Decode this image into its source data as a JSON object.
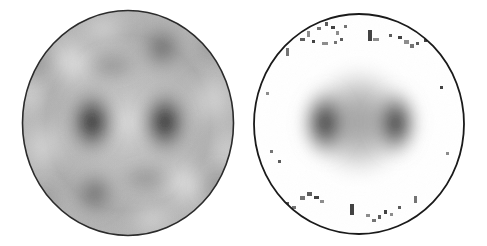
{
  "figure": {
    "title": "",
    "background_color": "#ffffff",
    "width": 487,
    "height": 246,
    "panel_count": 2,
    "layout": "two circular grayscale maps side by side"
  },
  "chart_data": {
    "type": "heatmap",
    "title": "",
    "subtitle": "",
    "xlabel": "",
    "ylabel": "",
    "colormap": "grayscale-inverted",
    "colormap_low_color": "#ffffff",
    "colormap_high_color": "#1a1a1a",
    "grid": false,
    "legend": false,
    "legend_position": "none",
    "panels": [
      {
        "name": "simulated-pattern",
        "label": "",
        "shape": "ellipse",
        "center_x": 128,
        "center_y": 123,
        "radius_x": 106,
        "radius_y": 113,
        "outline_color": "#2b2b2b",
        "outline_width": 1.6,
        "fill_base_gray": "#bdbdbd",
        "noise": "none",
        "description": "smooth continuous grayscale interference pattern with concentric bright ring and four dark lobes",
        "features": [
          {
            "name": "dark-lobe-left",
            "x": 92,
            "y": 122,
            "rx": 22,
            "ry": 30,
            "intensity": 0.96
          },
          {
            "name": "dark-lobe-right",
            "x": 165,
            "y": 122,
            "rx": 22,
            "ry": 30,
            "intensity": 0.96
          },
          {
            "name": "dark-lobe-upper",
            "x": 162,
            "y": 48,
            "rx": 20,
            "ry": 22,
            "intensity": 0.55
          },
          {
            "name": "dark-lobe-lower",
            "x": 95,
            "y": 192,
            "rx": 20,
            "ry": 20,
            "intensity": 0.5
          },
          {
            "name": "bright-node-upper-left",
            "x": 72,
            "y": 62,
            "rx": 24,
            "ry": 22,
            "intensity": 0.92
          },
          {
            "name": "bright-node-lower-right",
            "x": 183,
            "y": 183,
            "rx": 24,
            "ry": 22,
            "intensity": 0.88
          },
          {
            "name": "bright-node-left",
            "x": 45,
            "y": 145,
            "rx": 20,
            "ry": 26,
            "intensity": 0.7
          },
          {
            "name": "bright-node-right",
            "x": 210,
            "y": 100,
            "rx": 20,
            "ry": 26,
            "intensity": 0.7
          },
          {
            "name": "bright-center",
            "x": 128,
            "y": 122,
            "rx": 14,
            "ry": 22,
            "intensity": 0.62
          }
        ]
      },
      {
        "name": "measured-pattern",
        "label": "",
        "shape": "ellipse",
        "center_x": 359,
        "center_y": 124,
        "radius_x": 106,
        "radius_y": 111,
        "outline_color": "#1a1a1a",
        "outline_width": 1.8,
        "fill_base_gray": "#ffffff",
        "noise": "sparse dark speckle artifacts near rim",
        "description": "measured map: hexagonal gray core with two dark lobes, white surround and scattered dark pixel artifacts",
        "features": [
          {
            "name": "core-blob",
            "x": 359,
            "y": 120,
            "rx": 56,
            "ry": 56,
            "intensity": 0.38
          },
          {
            "name": "dark-lobe-left",
            "x": 325,
            "y": 123,
            "rx": 22,
            "ry": 33,
            "intensity": 1.0
          },
          {
            "name": "dark-lobe-right",
            "x": 396,
            "y": 123,
            "rx": 21,
            "ry": 32,
            "intensity": 0.98
          }
        ],
        "speckles": [
          {
            "x": 307,
            "y": 31,
            "w": 3,
            "h": 6
          },
          {
            "x": 317,
            "y": 27,
            "w": 4,
            "h": 3
          },
          {
            "x": 325,
            "y": 22,
            "w": 3,
            "h": 4
          },
          {
            "x": 331,
            "y": 26,
            "w": 4,
            "h": 3
          },
          {
            "x": 336,
            "y": 31,
            "w": 3,
            "h": 4
          },
          {
            "x": 344,
            "y": 25,
            "w": 3,
            "h": 3
          },
          {
            "x": 300,
            "y": 38,
            "w": 5,
            "h": 3
          },
          {
            "x": 312,
            "y": 40,
            "w": 3,
            "h": 3
          },
          {
            "x": 322,
            "y": 42,
            "w": 6,
            "h": 3
          },
          {
            "x": 334,
            "y": 41,
            "w": 3,
            "h": 3
          },
          {
            "x": 340,
            "y": 38,
            "w": 3,
            "h": 3
          },
          {
            "x": 368,
            "y": 30,
            "w": 4,
            "h": 11
          },
          {
            "x": 373,
            "y": 38,
            "w": 6,
            "h": 3
          },
          {
            "x": 286,
            "y": 48,
            "w": 3,
            "h": 8
          },
          {
            "x": 389,
            "y": 34,
            "w": 3,
            "h": 3
          },
          {
            "x": 398,
            "y": 36,
            "w": 4,
            "h": 3
          },
          {
            "x": 404,
            "y": 40,
            "w": 5,
            "h": 4
          },
          {
            "x": 410,
            "y": 44,
            "w": 4,
            "h": 4
          },
          {
            "x": 416,
            "y": 42,
            "w": 3,
            "h": 3
          },
          {
            "x": 424,
            "y": 39,
            "w": 3,
            "h": 3
          },
          {
            "x": 266,
            "y": 92,
            "w": 3,
            "h": 3
          },
          {
            "x": 270,
            "y": 150,
            "w": 3,
            "h": 3
          },
          {
            "x": 278,
            "y": 160,
            "w": 3,
            "h": 3
          },
          {
            "x": 440,
            "y": 86,
            "w": 3,
            "h": 3
          },
          {
            "x": 446,
            "y": 152,
            "w": 3,
            "h": 3
          },
          {
            "x": 300,
            "y": 196,
            "w": 5,
            "h": 4
          },
          {
            "x": 307,
            "y": 192,
            "w": 5,
            "h": 4
          },
          {
            "x": 314,
            "y": 196,
            "w": 5,
            "h": 3
          },
          {
            "x": 320,
            "y": 200,
            "w": 4,
            "h": 3
          },
          {
            "x": 292,
            "y": 206,
            "w": 4,
            "h": 3
          },
          {
            "x": 286,
            "y": 202,
            "w": 3,
            "h": 3
          },
          {
            "x": 350,
            "y": 204,
            "w": 4,
            "h": 11
          },
          {
            "x": 366,
            "y": 214,
            "w": 4,
            "h": 3
          },
          {
            "x": 372,
            "y": 219,
            "w": 4,
            "h": 3
          },
          {
            "x": 378,
            "y": 215,
            "w": 3,
            "h": 4
          },
          {
            "x": 384,
            "y": 210,
            "w": 3,
            "h": 4
          },
          {
            "x": 390,
            "y": 213,
            "w": 3,
            "h": 3
          },
          {
            "x": 414,
            "y": 196,
            "w": 3,
            "h": 7
          },
          {
            "x": 398,
            "y": 206,
            "w": 3,
            "h": 3
          }
        ]
      }
    ]
  }
}
